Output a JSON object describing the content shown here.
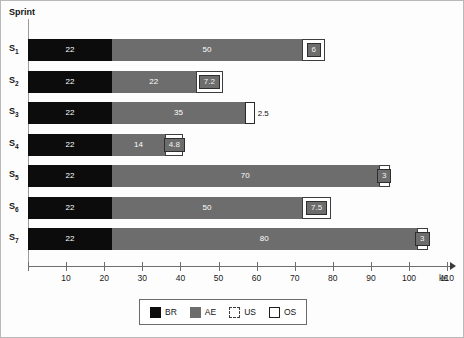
{
  "chart_data": {
    "type": "bar",
    "orientation": "horizontal",
    "stacked": true,
    "title": "",
    "xlabel": "k€",
    "ylabel": "Sprint",
    "xlim": [
      0,
      110
    ],
    "xticks": [
      0,
      10,
      20,
      30,
      40,
      50,
      60,
      70,
      80,
      90,
      100,
      110
    ],
    "xtick_labels": [
      "",
      "10",
      "20",
      "30",
      "40",
      "50",
      "60",
      "70",
      "80",
      "90",
      "100",
      "110"
    ],
    "grid": false,
    "legend_position": "bottom",
    "categories": [
      "S₁",
      "S₂",
      "S₃",
      "S₄",
      "S₅",
      "S₆",
      "S₇"
    ],
    "series": [
      {
        "name": "BR",
        "color": "#0c0c0c",
        "values": [
          22,
          22,
          22,
          22,
          22,
          22,
          22
        ]
      },
      {
        "name": "AE",
        "color": "#6d6d6d",
        "values": [
          50,
          22,
          35,
          14,
          70,
          50,
          80
        ]
      },
      {
        "name": "US",
        "color": "#ffffff",
        "values": [
          6,
          7.2,
          2.5,
          4.8,
          3,
          7.5,
          3
        ]
      },
      {
        "name": "OS",
        "color": "#ffffff",
        "values": [
          0,
          0,
          0,
          0,
          0,
          0,
          0
        ]
      }
    ],
    "totals": [
      78,
      51.2,
      59.5,
      40.8,
      95,
      79.5,
      105
    ]
  },
  "axis": {
    "y_title": "Sprint",
    "x_unit": "k€",
    "ticks": [
      {
        "value": 0,
        "label": ""
      },
      {
        "value": 10,
        "label": "10"
      },
      {
        "value": 20,
        "label": "20"
      },
      {
        "value": 30,
        "label": "30"
      },
      {
        "value": 40,
        "label": "40"
      },
      {
        "value": 50,
        "label": "50"
      },
      {
        "value": 60,
        "label": "60"
      },
      {
        "value": 70,
        "label": "70"
      },
      {
        "value": 80,
        "label": "80"
      },
      {
        "value": 90,
        "label": "90"
      },
      {
        "value": 100,
        "label": "100"
      },
      {
        "value": 110,
        "label": "110"
      }
    ]
  },
  "rows": [
    {
      "label": "S",
      "sub": "1",
      "segments": [
        {
          "series": "BR",
          "value": 22,
          "display": "22",
          "label_inside": true
        },
        {
          "series": "AE",
          "value": 50,
          "display": "50",
          "label_inside": true
        },
        {
          "series": "US",
          "value": 6,
          "display": "6",
          "label_inside": true
        }
      ]
    },
    {
      "label": "S",
      "sub": "2",
      "segments": [
        {
          "series": "BR",
          "value": 22,
          "display": "22",
          "label_inside": true
        },
        {
          "series": "AE",
          "value": 22,
          "display": "22",
          "label_inside": true
        },
        {
          "series": "US",
          "value": 7.2,
          "display": "7.2",
          "label_inside": true
        }
      ]
    },
    {
      "label": "S",
      "sub": "3",
      "segments": [
        {
          "series": "BR",
          "value": 22,
          "display": "22",
          "label_inside": true
        },
        {
          "series": "AE",
          "value": 35,
          "display": "35",
          "label_inside": true
        },
        {
          "series": "OS",
          "value": 2.5,
          "display": "2.5",
          "label_inside": false
        }
      ]
    },
    {
      "label": "S",
      "sub": "4",
      "segments": [
        {
          "series": "BR",
          "value": 22,
          "display": "22",
          "label_inside": true
        },
        {
          "series": "AE",
          "value": 14,
          "display": "14",
          "label_inside": true
        },
        {
          "series": "US",
          "value": 4.8,
          "display": "4.8",
          "label_inside": true
        }
      ]
    },
    {
      "label": "S",
      "sub": "5",
      "segments": [
        {
          "series": "BR",
          "value": 22,
          "display": "22",
          "label_inside": true
        },
        {
          "series": "AE",
          "value": 70,
          "display": "70",
          "label_inside": true
        },
        {
          "series": "US",
          "value": 3,
          "display": "3",
          "label_inside": true
        }
      ]
    },
    {
      "label": "S",
      "sub": "6",
      "segments": [
        {
          "series": "BR",
          "value": 22,
          "display": "22",
          "label_inside": true
        },
        {
          "series": "AE",
          "value": 50,
          "display": "50",
          "label_inside": true
        },
        {
          "series": "US",
          "value": 7.5,
          "display": "7.5",
          "label_inside": true
        }
      ]
    },
    {
      "label": "S",
      "sub": "7",
      "segments": [
        {
          "series": "BR",
          "value": 22,
          "display": "22",
          "label_inside": true
        },
        {
          "series": "AE",
          "value": 80,
          "display": "80",
          "label_inside": true
        },
        {
          "series": "US",
          "value": 3,
          "display": "3",
          "label_inside": true
        }
      ]
    }
  ],
  "legend": {
    "items": [
      {
        "key": "BR",
        "label": "BR",
        "swatch": "solid-black"
      },
      {
        "key": "AE",
        "label": "AE",
        "swatch": "solid-gray"
      },
      {
        "key": "US",
        "label": "US",
        "swatch": "dashed-outline"
      },
      {
        "key": "OS",
        "label": "OS",
        "swatch": "solid-outline"
      }
    ]
  }
}
